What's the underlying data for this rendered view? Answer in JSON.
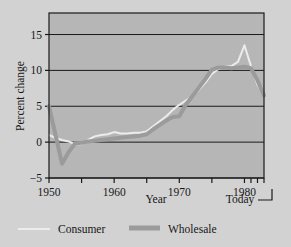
{
  "figure": {
    "name": "inflation-line-chart",
    "background_color": "#d2d2d2",
    "plot_background_color": "#b6b6b6"
  },
  "chart_data": {
    "type": "line",
    "title": "",
    "subtitle": "",
    "xlabel": "Year",
    "ylabel": "Percent change",
    "xlim": [
      1950,
      1983
    ],
    "ylim": [
      -5,
      18
    ],
    "grid": true,
    "grid_axis": "y",
    "legend_position": "bottom",
    "end_annotation": "Today",
    "y_ticks": [
      -5,
      0,
      5,
      10,
      15
    ],
    "y_tick_labels": [
      "−5",
      "0",
      "5",
      "10",
      "15"
    ],
    "x_ticks": [
      1950,
      1955,
      1960,
      1965,
      1970,
      1975,
      1980,
      1981,
      1982,
      1983
    ],
    "x_tick_labels": [
      "1950",
      "",
      "1960",
      "",
      "1970",
      "",
      "1980",
      "",
      "",
      ""
    ],
    "x_major_labels": [
      {
        "value": 1950,
        "label": "1950"
      },
      {
        "value": 1960,
        "label": "1960"
      },
      {
        "value": 1970,
        "label": "1970"
      },
      {
        "value": 1980,
        "label": "1980"
      }
    ],
    "series": [
      {
        "name": "Consumer",
        "color": "#ececec",
        "line_width": 2.0,
        "x": [
          1950,
          1951,
          1952,
          1953,
          1954,
          1955,
          1956,
          1957,
          1958,
          1959,
          1960,
          1961,
          1962,
          1963,
          1964,
          1965,
          1966,
          1967,
          1968,
          1969,
          1970,
          1971,
          1972,
          1973,
          1974,
          1975,
          1976,
          1977,
          1978,
          1979,
          1980,
          1981,
          1982,
          1983
        ],
        "values": [
          1.0,
          0.6,
          0.3,
          0.1,
          -0.3,
          -0.3,
          0.3,
          0.8,
          1.0,
          1.1,
          1.4,
          1.2,
          1.2,
          1.3,
          1.3,
          1.5,
          2.2,
          2.9,
          3.6,
          4.5,
          5.2,
          5.8,
          6.4,
          7.3,
          8.3,
          9.5,
          10.2,
          10.5,
          10.6,
          11.2,
          13.5,
          10.6,
          8.0,
          6.5
        ]
      },
      {
        "name": "Wholesale",
        "color": "#9b9b9b",
        "line_width": 4.0,
        "x": [
          1950,
          1951,
          1952,
          1953,
          1954,
          1955,
          1956,
          1957,
          1958,
          1959,
          1960,
          1961,
          1962,
          1963,
          1964,
          1965,
          1966,
          1967,
          1968,
          1969,
          1970,
          1971,
          1972,
          1973,
          1974,
          1975,
          1976,
          1977,
          1978,
          1979,
          1980,
          1981,
          1982,
          1983
        ],
        "values": [
          5.0,
          1.0,
          -3.0,
          -1.4,
          -0.2,
          -0.1,
          0.1,
          0.2,
          0.3,
          0.4,
          0.5,
          0.6,
          0.7,
          0.8,
          0.9,
          1.1,
          1.8,
          2.4,
          3.0,
          3.5,
          3.6,
          5.2,
          6.4,
          7.6,
          8.8,
          10.1,
          10.4,
          10.4,
          10.3,
          10.4,
          10.5,
          10.3,
          8.6,
          6.5
        ]
      }
    ],
    "legend": [
      {
        "label": "Consumer",
        "color": "#ececec",
        "line_width": 2.0
      },
      {
        "label": "Wholesale",
        "color": "#9b9b9b",
        "line_width": 5.0
      }
    ]
  }
}
